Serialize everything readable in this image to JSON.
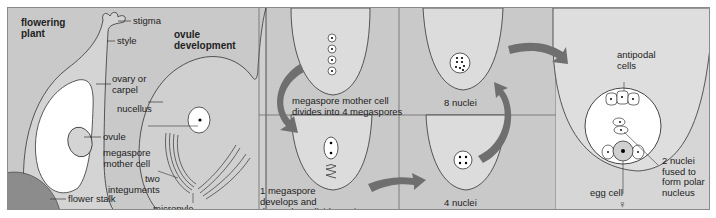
{
  "diagram": {
    "panels": [
      {
        "id": "flowering-plant",
        "title": "flowering plant",
        "labels": [
          "stigma",
          "style",
          "ovary or carpel",
          "nucellus",
          "ovule",
          "flower stalk"
        ]
      },
      {
        "id": "ovule-development",
        "title": "ovule development",
        "labels": [
          "megaspore mother cell",
          "two integuments",
          "micropyle"
        ]
      },
      {
        "id": "step-1",
        "caption": "megaspore mother cell divides into 4 megaspores"
      },
      {
        "id": "step-2",
        "caption": "1 megaspore develops and the nucleus divides 3 times"
      },
      {
        "id": "step-3",
        "caption": "4 nuclei"
      },
      {
        "id": "step-4",
        "caption": "8 nuclei"
      },
      {
        "id": "embryo-sac",
        "labels": [
          "antipodal cells",
          "2 nuclei fused to form polar nucleus",
          "egg cell",
          "♀"
        ]
      }
    ]
  },
  "text": {
    "fp_title_1": "flowering",
    "fp_title_2": "plant",
    "stigma": "stigma",
    "style": "style",
    "ovary_1": "ovary or",
    "ovary_2": "carpel",
    "nucellus": "nucellus",
    "ovule": "ovule",
    "mmc_1": "megaspore",
    "mmc_2": "mother cell",
    "integ_1": "two",
    "integ_2": "integuments",
    "flower_stalk": "flower stalk",
    "od_title_1": "ovule",
    "od_title_2": "development",
    "micropyle": "micropyle",
    "step1_1": "megaspore mother cell",
    "step1_2": "divides into 4 megaspores",
    "step2_1": "1 megaspore",
    "step2_2": "develops and",
    "step2_3": "the nucleus divides 3 times",
    "nuclei4": "4 nuclei",
    "nuclei8": "8 nuclei",
    "antipodal_1": "antipodal",
    "antipodal_2": "cells",
    "polar_1": "2 nuclei",
    "polar_2": "fused to",
    "polar_3": "form polar",
    "polar_4": "nucleus",
    "egg": "egg cell",
    "female_symbol": "♀"
  },
  "colors": {
    "background": "#c9c9c9",
    "light_fill": "#dcdcdc",
    "white": "#ffffff",
    "dark_stalk": "#8c8c8c",
    "arrow": "#6f6f6f",
    "line": "#333333"
  }
}
